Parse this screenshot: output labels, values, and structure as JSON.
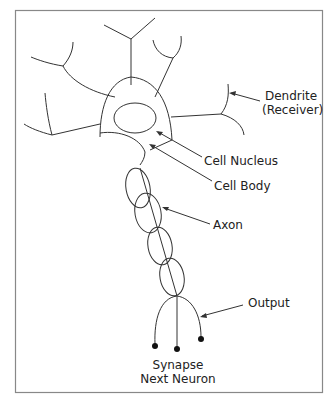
{
  "diagram": {
    "labels": {
      "dendrite_line1": "Dendrite",
      "dendrite_line2": "(Receiver)",
      "cell_nucleus": "Cell Nucleus",
      "cell_body": "Cell Body",
      "axon": "Axon",
      "output": "Output",
      "synapse_line1": "Synapse",
      "synapse_line2": "Next Neuron"
    },
    "colors": {
      "stroke": "#333333",
      "frame": "#888888",
      "text": "#222222"
    }
  }
}
